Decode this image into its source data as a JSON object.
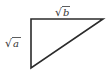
{
  "diagram": {
    "type": "right-triangle",
    "stroke_color": "#2b2b2b",
    "background": "#ffffff",
    "labels": {
      "top_side": {
        "radical": "√",
        "var": "b"
      },
      "left_side": {
        "radical": "√",
        "var": "a"
      }
    }
  }
}
